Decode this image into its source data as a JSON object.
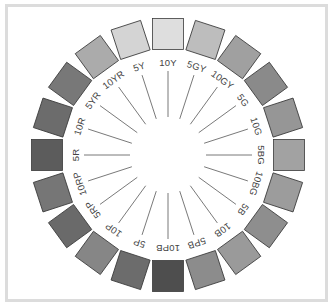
{
  "diagram": {
    "center": [
      168,
      155
    ],
    "swatch_radius": 121,
    "swatch_size": 31,
    "label_radius": 93,
    "spoke_inner_radius": 38,
    "spoke_outer_radius": 84,
    "frame_color": "#dcdcdc",
    "hues": [
      {
        "label": "10Y",
        "color": "#dedede"
      },
      {
        "label": "5GY",
        "color": "#bdbdbd"
      },
      {
        "label": "10GY",
        "color": "#a0a0a0"
      },
      {
        "label": "5G",
        "color": "#8a8a8a"
      },
      {
        "label": "10G",
        "color": "#969696"
      },
      {
        "label": "5BG",
        "color": "#a2a2a2"
      },
      {
        "label": "10BG",
        "color": "#9c9c9c"
      },
      {
        "label": "5B",
        "color": "#8e8e8e"
      },
      {
        "label": "10B",
        "color": "#9a9a9a"
      },
      {
        "label": "5PB",
        "color": "#8c8c8c"
      },
      {
        "label": "10PB",
        "color": "#4e4e4e"
      },
      {
        "label": "5P",
        "color": "#6c6c6c"
      },
      {
        "label": "10P",
        "color": "#868686"
      },
      {
        "label": "5RP",
        "color": "#6a6a6a"
      },
      {
        "label": "10RP",
        "color": "#767676"
      },
      {
        "label": "5R",
        "color": "#5c5c5c"
      },
      {
        "label": "10R",
        "color": "#6c6c6c"
      },
      {
        "label": "5YR",
        "color": "#787878"
      },
      {
        "label": "10YR",
        "color": "#ababab"
      },
      {
        "label": "5Y",
        "color": "#d4d4d4"
      }
    ]
  }
}
